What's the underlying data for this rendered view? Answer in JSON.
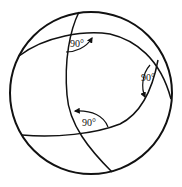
{
  "diagram": {
    "title": "",
    "colors": {
      "stroke": "#111111",
      "background": "#ffffff"
    },
    "sphere": {
      "cx": 91,
      "cy": 93,
      "r": 81
    },
    "angles": [
      {
        "label": "90°",
        "position": "top"
      },
      {
        "label": "90°",
        "position": "right"
      },
      {
        "label": "90°",
        "position": "bottom"
      }
    ]
  }
}
